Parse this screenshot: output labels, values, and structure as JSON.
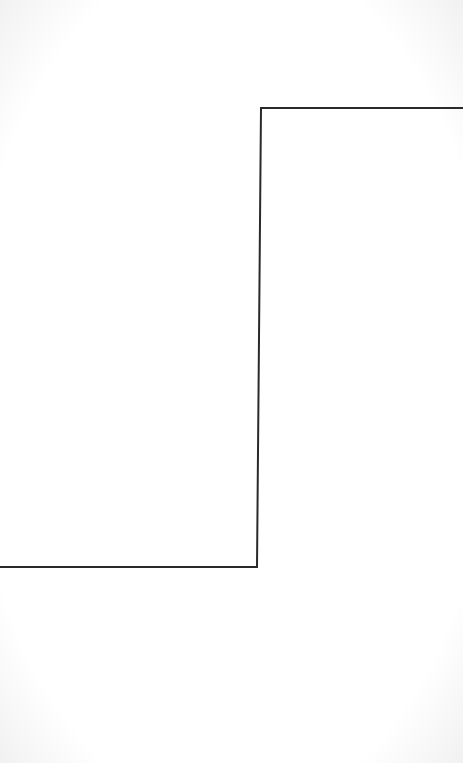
{
  "diagram": {
    "shape": "step-line",
    "stroke_color": "#2a2a2a",
    "stroke_width": 2,
    "background_color": "#ffffff",
    "points": [
      [
        0,
        567
      ],
      [
        257,
        567
      ],
      [
        261,
        108
      ],
      [
        463,
        108
      ]
    ]
  }
}
